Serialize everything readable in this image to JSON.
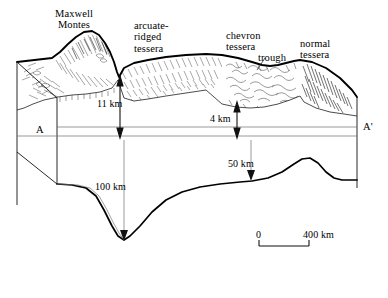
{
  "figure": {
    "type": "geologic-cross-section-block-diagram"
  },
  "feature_labels": [
    {
      "id": "maxwell-montes",
      "line1": "Maxwell",
      "line2": "Montes",
      "x": 62,
      "y": 8,
      "align": "center"
    },
    {
      "id": "arcuate-ridged-tessera",
      "line1": "arcuate-",
      "line2": "ridged",
      "line3": "tessera",
      "x": 134,
      "y": 20,
      "align": "left"
    },
    {
      "id": "chevron-tessera",
      "line1": "chevron",
      "line2": "tessera",
      "x": 226,
      "y": 30,
      "align": "left"
    },
    {
      "id": "trough",
      "line1": "trough",
      "x": 258,
      "y": 54,
      "align": "left"
    },
    {
      "id": "normal-tessera",
      "line1": "normal",
      "line2": "tessera",
      "x": 300,
      "y": 40,
      "align": "left"
    }
  ],
  "measurements": [
    {
      "id": "elevation-11km",
      "value": "11 km",
      "x": 104,
      "y": 99
    },
    {
      "id": "elevation-4km",
      "value": "4 km",
      "x": 212,
      "y": 113
    },
    {
      "id": "depth-50km",
      "value": "50 km",
      "x": 232,
      "y": 164
    },
    {
      "id": "depth-100km",
      "value": "100 km",
      "x": 100,
      "y": 186
    }
  ],
  "section_endpoints": [
    {
      "id": "section-start",
      "label": "A",
      "x": 38,
      "y": 126
    },
    {
      "id": "section-end",
      "label": "A'",
      "x": 364,
      "y": 123
    }
  ],
  "scale_bar": {
    "left_label": "0",
    "right_label": "400 km",
    "x_start": 259,
    "x_end": 309,
    "y": 246,
    "label_y": 232
  },
  "colors": {
    "ink": "#000000",
    "thin_rule": "#6d6d6d",
    "texture": "#2b2b2b",
    "background": "#ffffff"
  }
}
